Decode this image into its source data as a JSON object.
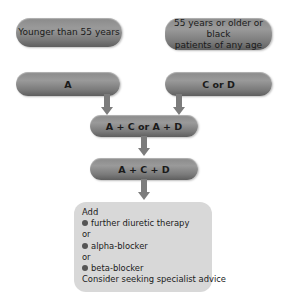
{
  "diagram": {
    "start_left": "Younger than 55 years",
    "start_right_line1": "55 years or older or black",
    "start_right_line2": "patients of any age",
    "step1_left": "A",
    "step1_right": "C or D",
    "step2": "A + C or A + D",
    "step3": "A + C + D",
    "step4": {
      "intro": "Add",
      "options": [
        "further diuretic therapy",
        "alpha-blocker",
        "beta-blocker"
      ],
      "separator": "or",
      "footer": "Consider seeking specialist advice"
    }
  },
  "colors": {
    "pill": "#8a8a8a",
    "arrow": "#7c7c7c",
    "final_box": "#d8d8d8",
    "text": "#1a1a1a"
  }
}
